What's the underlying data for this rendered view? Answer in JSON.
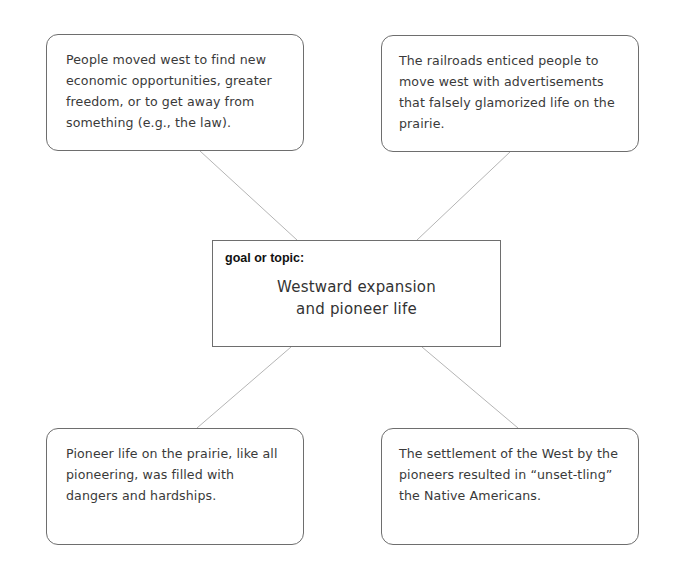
{
  "diagram": {
    "type": "concept-web",
    "center": {
      "label": "goal or topic:",
      "lines": [
        "Westward expansion",
        "and pioneer life"
      ]
    },
    "nodes": [
      {
        "position": "top-left",
        "text": "People moved west to find new economic opportunities, greater freedom, or to get away from something (e.g., the law)."
      },
      {
        "position": "top-right",
        "text": "The railroads enticed people to move west with advertisements that falsely glamorized life on the prairie."
      },
      {
        "position": "bottom-left",
        "text": "Pioneer life on the prairie, like all pioneering, was filled with dangers and hardships."
      },
      {
        "position": "bottom-right",
        "text": "The settlement of the West by the pioneers resulted in “unset-tling” the Native Americans."
      }
    ],
    "colors": {
      "border": "#6e6e6e",
      "connector": "#b5b5b5",
      "text": "#3a3a3a",
      "label": "#111111"
    }
  }
}
